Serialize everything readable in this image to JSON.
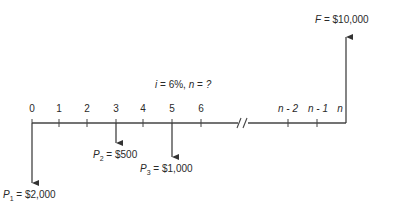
{
  "diagram": {
    "type": "cash-flow-diagram",
    "parameters_label": "i = 6%, n = ?",
    "parameters": {
      "i_label": "i",
      "i_value": "6%",
      "n_label": "n",
      "n_value": "?"
    },
    "periods": [
      {
        "label": "0",
        "x": 32
      },
      {
        "label": "1",
        "x": 59
      },
      {
        "label": "2",
        "x": 87
      },
      {
        "label": "3",
        "x": 116
      },
      {
        "label": "4",
        "x": 143
      },
      {
        "label": "5",
        "x": 172
      },
      {
        "label": "6",
        "x": 201
      },
      {
        "label": "n - 2",
        "x": 288
      },
      {
        "label": "n - 1",
        "x": 317
      },
      {
        "label": "n",
        "x": 346
      }
    ],
    "break_symbol": "//",
    "cash_flows": [
      {
        "name": "P",
        "sub": "1",
        "value": "$2,000",
        "period": "0",
        "direction": "down"
      },
      {
        "name": "P",
        "sub": "2",
        "value": "$500",
        "period": "3",
        "direction": "down"
      },
      {
        "name": "P",
        "sub": "3",
        "value": "$1,000",
        "period": "5",
        "direction": "down"
      },
      {
        "name": "F",
        "sub": "",
        "value": "$10,000",
        "period": "n",
        "direction": "up"
      }
    ],
    "line_color": "#333333"
  }
}
